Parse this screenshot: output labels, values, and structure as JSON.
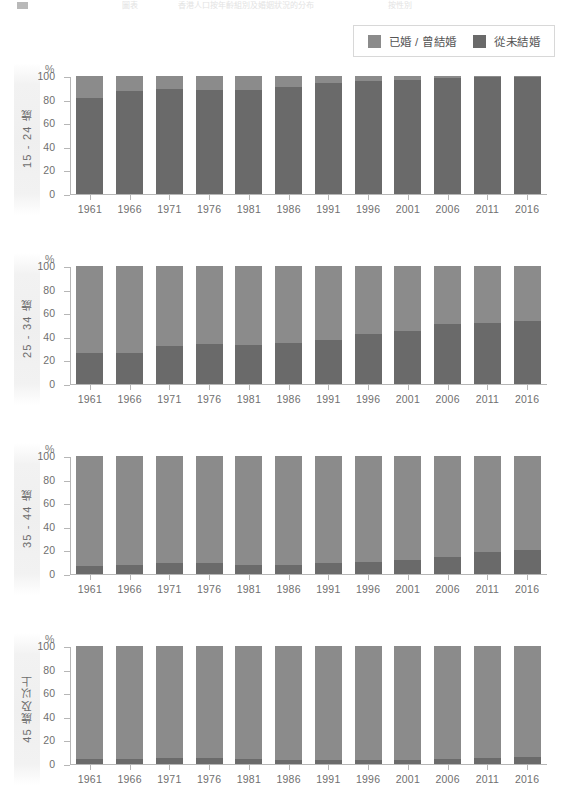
{
  "header": {
    "swatch_icon": "square-icon",
    "fragment_1": "圖表",
    "fragment_2": "香港人口按年齡組別及婚姻狀況的分布",
    "fragment_3": "按性別"
  },
  "legend": {
    "position": "top-right",
    "items": [
      {
        "label": "已婚 / 曾結婚",
        "color": "#8b8b8b",
        "swatch_icon": "square-icon"
      },
      {
        "label": "從未結婚",
        "color": "#6a6a6a",
        "swatch_icon": "square-icon"
      }
    ]
  },
  "axis": {
    "unit": "%",
    "yticks": [
      "100",
      "80",
      "60",
      "40",
      "20",
      "0"
    ],
    "ylim": [
      0,
      100
    ],
    "xticks": [
      "1961",
      "1966",
      "1971",
      "1976",
      "1981",
      "1986",
      "1991",
      "1996",
      "2001",
      "2006",
      "2011",
      "2016"
    ]
  },
  "panels": [
    {
      "side_label": "15 - 24 歲"
    },
    {
      "side_label": "25 - 34 歲"
    },
    {
      "side_label": "35 - 44 歲"
    },
    {
      "side_label": "45 歲及以上"
    }
  ],
  "chart_data": {
    "type": "bar",
    "title": "",
    "subtitle": "",
    "stacked": true,
    "normalized_to_100": true,
    "xlabel": "",
    "ylabel": "%",
    "ylim": [
      0,
      100
    ],
    "grid": false,
    "legend_position": "top-right",
    "categories": [
      "1961",
      "1966",
      "1971",
      "1976",
      "1981",
      "1986",
      "1991",
      "1996",
      "2001",
      "2006",
      "2011",
      "2016"
    ],
    "panels": [
      {
        "name": "15 - 24 歲",
        "series": [
          {
            "name": "從未結婚",
            "color": "#6a6a6a",
            "values": [
              81,
              87,
              89,
              88,
              88,
              91,
              94,
              96,
              97,
              98,
              99,
              99
            ]
          },
          {
            "name": "已婚 / 曾結婚",
            "color": "#8b8b8b",
            "values": [
              19,
              13,
              11,
              12,
              12,
              9,
              6,
              4,
              3,
              2,
              1,
              1
            ]
          }
        ]
      },
      {
        "name": "25 - 34 歲",
        "series": [
          {
            "name": "從未結婚",
            "color": "#6a6a6a",
            "values": [
              26,
              26,
              32,
              34,
              33,
              35,
              37,
              42,
              45,
              51,
              52,
              53
            ]
          },
          {
            "name": "已婚 / 曾結婚",
            "color": "#8b8b8b",
            "values": [
              74,
              74,
              68,
              66,
              67,
              65,
              63,
              58,
              55,
              49,
              48,
              47
            ]
          }
        ]
      },
      {
        "name": "35 - 44 歲",
        "series": [
          {
            "name": "從未結婚",
            "color": "#6a6a6a",
            "values": [
              7,
              8,
              9,
              9,
              8,
              8,
              9,
              10,
              12,
              14,
              19,
              20
            ]
          },
          {
            "name": "已婚 / 曾結婚",
            "color": "#8b8b8b",
            "values": [
              93,
              92,
              91,
              91,
              92,
              92,
              91,
              90,
              88,
              86,
              81,
              80
            ]
          }
        ]
      },
      {
        "name": "45 歲及以上",
        "series": [
          {
            "name": "從未結婚",
            "color": "#6a6a6a",
            "values": [
              4,
              4,
              5,
              5,
              4,
              3,
              3,
              3,
              3,
              4,
              5,
              6
            ]
          },
          {
            "name": "已婚 / 曾結婚",
            "color": "#8b8b8b",
            "values": [
              96,
              96,
              95,
              95,
              96,
              97,
              97,
              97,
              97,
              96,
              95,
              94
            ]
          }
        ]
      }
    ]
  }
}
